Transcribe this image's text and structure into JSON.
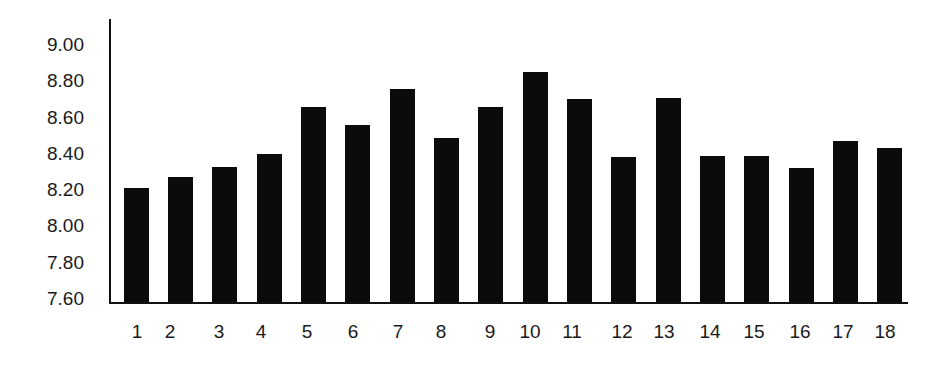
{
  "chart_data": {
    "type": "bar",
    "title": "",
    "xlabel": "",
    "ylabel": "",
    "categories": [
      "1",
      "2",
      "3",
      "4",
      "5",
      "6",
      "7",
      "8",
      "9",
      "10",
      "11",
      "12",
      "13",
      "14",
      "15",
      "16",
      "17",
      "18"
    ],
    "values": [
      8.21,
      8.27,
      8.33,
      8.4,
      8.66,
      8.56,
      8.76,
      8.49,
      8.66,
      8.85,
      8.7,
      8.38,
      8.71,
      8.39,
      8.39,
      8.32,
      8.47,
      8.43
    ],
    "ylim": [
      7.6,
      9.0
    ],
    "yticks": [
      "9.00",
      "8.80",
      "8.60",
      "8.40",
      "8.20",
      "8.00",
      "7.80",
      "7.60"
    ],
    "grid": false,
    "legend": null,
    "bar_color": "#0b0b0b"
  },
  "layout": {
    "bar_left": [
      124,
      168,
      212,
      257,
      301,
      345,
      390,
      434,
      478,
      523,
      567,
      611,
      656,
      700,
      744,
      789,
      833,
      877
    ],
    "label_center": [
      137,
      170,
      219,
      261,
      307,
      353,
      398,
      441,
      490,
      530,
      572,
      622,
      664,
      710,
      754,
      800,
      843,
      885
    ]
  }
}
